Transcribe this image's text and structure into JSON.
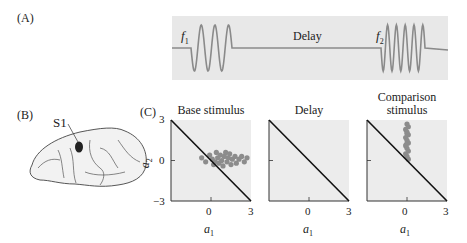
{
  "panels": {
    "A": {
      "label": "(A)",
      "f1_label": "f",
      "f1_sub": "1",
      "delay_label": "Delay",
      "f2_label": "f",
      "f2_sub": "2",
      "f1_cycles": 3,
      "f2_cycles": 5,
      "background_color": "#e8e8e8",
      "wave_color": "#8a8a8a"
    },
    "B": {
      "label": "(B)",
      "region_label": "S1"
    },
    "C": {
      "label": "(C)",
      "plots": [
        {
          "title": "Base stimulus"
        },
        {
          "title": "Delay"
        },
        {
          "title_line1": "Comparison",
          "title_line2": "stimulus"
        }
      ],
      "y_ticks": [
        "3",
        "0",
        "−3"
      ],
      "x_ticks": [
        "0",
        "3"
      ],
      "x_label": "a",
      "x_label_sub": "1",
      "y_label": "a",
      "y_label_sub": "2",
      "dot_color": "#8c8c8c",
      "plot_bg": "#ececec"
    }
  },
  "chart_data": [
    {
      "type": "scatter",
      "title": "Base stimulus",
      "xlabel": "a1",
      "ylabel": "a2",
      "xlim": [
        -3,
        3
      ],
      "ylim": [
        -3,
        3
      ],
      "reference_line": {
        "from": [
          -3,
          3
        ],
        "to": [
          3,
          -3
        ]
      },
      "points": [
        [
          -0.7,
          0.2
        ],
        [
          -0.4,
          -0.1
        ],
        [
          -0.1,
          0.4
        ],
        [
          0.1,
          0.1
        ],
        [
          0.2,
          -0.3
        ],
        [
          0.4,
          0.6
        ],
        [
          0.5,
          0.2
        ],
        [
          0.6,
          -0.2
        ],
        [
          0.7,
          0.4
        ],
        [
          0.8,
          0.0
        ],
        [
          0.9,
          -0.4
        ],
        [
          1.0,
          0.3
        ],
        [
          1.1,
          0.6
        ],
        [
          1.2,
          -0.1
        ],
        [
          1.3,
          0.2
        ],
        [
          1.5,
          -0.3
        ],
        [
          1.6,
          0.1
        ],
        [
          1.8,
          0.3
        ],
        [
          1.9,
          -0.2
        ],
        [
          2.1,
          0.1
        ],
        [
          2.3,
          0.3
        ],
        [
          2.5,
          -0.1
        ],
        [
          2.7,
          0.2
        ],
        [
          1.4,
          0.5
        ],
        [
          0.3,
          -0.1
        ]
      ]
    },
    {
      "type": "scatter",
      "title": "Delay",
      "xlabel": "a1",
      "ylabel": "a2",
      "xlim": [
        -3,
        3
      ],
      "ylim": [
        -3,
        3
      ],
      "reference_line": {
        "from": [
          -3,
          3
        ],
        "to": [
          3,
          -3
        ]
      },
      "points": []
    },
    {
      "type": "scatter",
      "title": "Comparison stimulus",
      "xlabel": "a1",
      "ylabel": "a2",
      "xlim": [
        -3,
        3
      ],
      "ylim": [
        -3,
        3
      ],
      "reference_line": {
        "from": [
          -3,
          3
        ],
        "to": [
          3,
          -3
        ]
      },
      "points": [
        [
          0.0,
          2.7
        ],
        [
          0.1,
          2.5
        ],
        [
          -0.1,
          2.3
        ],
        [
          0.0,
          2.1
        ],
        [
          0.1,
          1.9
        ],
        [
          -0.1,
          1.7
        ],
        [
          0.0,
          1.5
        ],
        [
          0.1,
          1.3
        ],
        [
          -0.1,
          1.1
        ],
        [
          0.0,
          0.9
        ],
        [
          0.1,
          0.7
        ],
        [
          -0.1,
          0.5
        ],
        [
          0.0,
          0.3
        ],
        [
          0.1,
          0.1
        ],
        [
          0.0,
          2.0
        ],
        [
          -0.05,
          1.2
        ]
      ]
    }
  ]
}
